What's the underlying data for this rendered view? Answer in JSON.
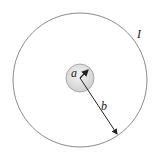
{
  "diagram": {
    "labels": {
      "inner_radius": "a",
      "outer_radius": "b",
      "current": "I"
    },
    "colors": {
      "outer_circle": "#8a8a8a",
      "inner_fill": "#e2e2e2",
      "inner_stroke": "#9a9a9a",
      "arrow": "#222222"
    }
  }
}
